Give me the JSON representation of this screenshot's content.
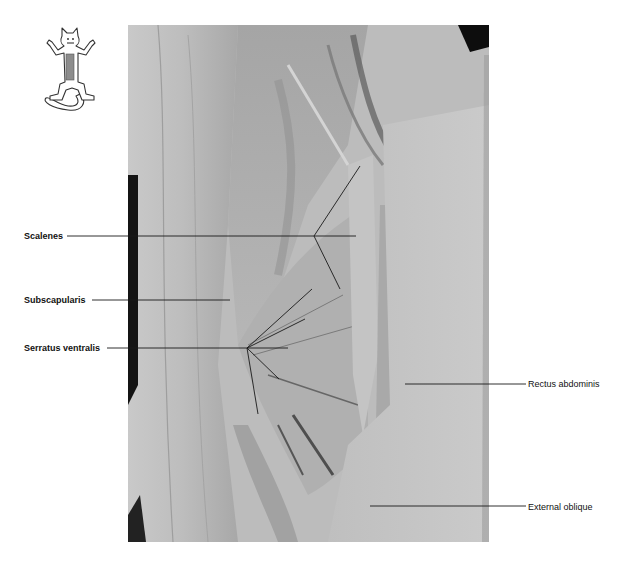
{
  "figure": {
    "orientation_icon": "cat-ventral-view-icon",
    "labels_left": [
      {
        "id": "scalenes",
        "text": "Scalenes"
      },
      {
        "id": "subscapularis",
        "text": "Subscapularis"
      },
      {
        "id": "serratus-ventralis",
        "text": "Serratus ventralis"
      }
    ],
    "labels_right": [
      {
        "id": "rectus-abdominis",
        "text": "Rectus abdominis"
      },
      {
        "id": "external-oblique",
        "text": "External oblique"
      }
    ]
  }
}
